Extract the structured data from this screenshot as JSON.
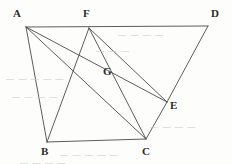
{
  "figure": {
    "canvas": {
      "width": 232,
      "height": 164
    },
    "stroke_color": "#4a4a48",
    "label_color": "#2b2b29",
    "background_color": "#fdfdfb",
    "ghost_color": "#cfcdc6",
    "points": [
      {
        "id": "A",
        "label": "A",
        "x": 26,
        "y": 27,
        "label_x": 13,
        "label_y": 8
      },
      {
        "id": "F",
        "label": "F",
        "x": 89,
        "y": 28,
        "label_x": 83,
        "label_y": 8
      },
      {
        "id": "D",
        "label": "D",
        "x": 208,
        "y": 26,
        "label_x": 211,
        "label_y": 8
      },
      {
        "id": "G",
        "label": "G",
        "x": 115,
        "y": 70,
        "label_x": 103,
        "label_y": 66
      },
      {
        "id": "E",
        "label": "E",
        "x": 167,
        "y": 102,
        "label_x": 170,
        "label_y": 100
      },
      {
        "id": "B",
        "label": "B",
        "x": 47,
        "y": 142,
        "label_x": 41,
        "label_y": 146
      },
      {
        "id": "C",
        "label": "C",
        "x": 146,
        "y": 139,
        "label_x": 142,
        "label_y": 146
      }
    ],
    "segments": [
      {
        "id": "AD",
        "from": "A",
        "to": "D",
        "description": "top horizontal through F"
      },
      {
        "id": "AB",
        "from": "A",
        "to": "B",
        "description": "left side"
      },
      {
        "id": "AC",
        "from": "A",
        "to": "C",
        "description": "diagonal A to C"
      },
      {
        "id": "AE",
        "from": "A",
        "to": "E",
        "description": "diagonal A to E through G"
      },
      {
        "id": "FB",
        "from": "F",
        "to": "B",
        "description": "diagonal F to B"
      },
      {
        "id": "FC",
        "from": "F",
        "to": "C",
        "description": "diagonal F to C through G"
      },
      {
        "id": "FE",
        "from": "F",
        "to": "E",
        "description": "diagonal F to E"
      },
      {
        "id": "BC",
        "from": "B",
        "to": "C",
        "description": "bottom horizontal"
      },
      {
        "id": "CE",
        "from": "C",
        "to": "E",
        "description": "right lower side"
      },
      {
        "id": "ED",
        "from": "E",
        "to": "D",
        "description": "right upper side"
      }
    ],
    "ghost_text_blocks": [
      {
        "id": "g1",
        "text": "—  —  —  —",
        "x": 118,
        "y": 30
      },
      {
        "id": "g2",
        "text": "—   —    —",
        "x": 96,
        "y": 46
      },
      {
        "id": "g3",
        "text": "—  —   —   —   —",
        "x": 6,
        "y": 74
      },
      {
        "id": "g4",
        "text": "—   —  —    —",
        "x": 12,
        "y": 92
      },
      {
        "id": "g5",
        "text": "—  —   —  —",
        "x": 150,
        "y": 122
      },
      {
        "id": "g6",
        "text": "—   —   —   —  —",
        "x": 60,
        "y": 150
      },
      {
        "id": "g7",
        "text": "—  —  —   —",
        "x": 20,
        "y": 158
      }
    ]
  }
}
